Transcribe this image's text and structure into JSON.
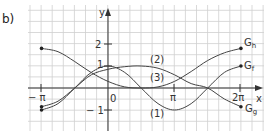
{
  "task_label": "b)",
  "chart_data": {
    "type": "line",
    "title": "",
    "xlabel": "x",
    "ylabel": "y",
    "x_ticks": [
      "−π",
      "0",
      "π",
      "2π"
    ],
    "y_ticks": [
      "2",
      "1",
      "−1"
    ],
    "xlim": [
      -3.14159,
      6.28318
    ],
    "ylim": [
      -1.5,
      2.5
    ],
    "grid": true,
    "series": [
      {
        "name": "G_f",
        "marker_label": "(1)",
        "x": [
          -3.14,
          -2.36,
          -1.57,
          -0.79,
          0,
          0.79,
          1.57,
          2.36,
          3.14,
          3.93,
          4.71,
          5.5,
          6.28
        ],
        "values": [
          -1.0,
          -0.71,
          0.0,
          0.71,
          1.0,
          0.71,
          0.0,
          -0.71,
          -1.0,
          -0.71,
          0.0,
          0.71,
          1.0
        ]
      },
      {
        "name": "G_g",
        "marker_label": "(2)",
        "x": [
          -3.14,
          -2.36,
          -1.57,
          -0.79,
          0,
          0.79,
          1.57,
          2.36,
          3.14,
          3.93,
          4.71,
          5.5,
          6.28
        ],
        "values": [
          -0.85,
          -0.6,
          0.0,
          0.6,
          0.85,
          0.97,
          1.0,
          0.9,
          0.6,
          0.2,
          0.0,
          -0.5,
          -0.85
        ]
      },
      {
        "name": "G_h",
        "marker_label": "(3)",
        "x": [
          -3.14,
          -2.36,
          -1.57,
          -0.79,
          0,
          0.79,
          1.57,
          2.36,
          3.14,
          3.93,
          4.71,
          5.5,
          6.28
        ],
        "values": [
          1.8,
          1.65,
          1.2,
          0.7,
          0.3,
          0.05,
          0.0,
          0.05,
          0.3,
          0.75,
          1.25,
          1.6,
          1.8
        ]
      }
    ],
    "labels": {
      "Gh": "G",
      "Gh_sub": "h",
      "Gf": "G",
      "Gf_sub": "f",
      "Gg": "G",
      "Gg_sub": "g",
      "c1": "(1)",
      "c2": "(2)",
      "c3": "(3)",
      "x_axis": "x",
      "y_axis": "y",
      "tick_neg_pi": "− π",
      "tick_zero": "0",
      "tick_pi": "π",
      "tick_2pi": "2π",
      "tick_y2": "2",
      "tick_y1": "1",
      "tick_yneg1": "− 1"
    }
  }
}
